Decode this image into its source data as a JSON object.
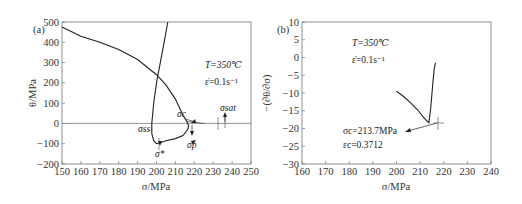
{
  "chart_data": [
    {
      "panel": "(a)",
      "type": "line",
      "title": "",
      "xlabel": "σ/MPa",
      "ylabel": "θ/MPa",
      "xlim": [
        150,
        250
      ],
      "ylim": [
        -200,
        500
      ],
      "xticks": [
        150,
        160,
        170,
        180,
        190,
        200,
        210,
        220,
        230,
        240,
        250
      ],
      "yticks": [
        500,
        400,
        300,
        200,
        100,
        0,
        -100,
        -200
      ],
      "grid": false,
      "annotations": {
        "temperature": "T=350℃",
        "strain_rate": "ε̇=0.1s⁻¹",
        "sigma_c": "σc",
        "sigma_sat": "σsat",
        "sigma_ss": "σss",
        "sigma_p": "σp",
        "sigma_star": "σ*"
      },
      "series": [
        {
          "name": "θ-σ curve",
          "x": [
            150,
            160,
            170,
            180,
            190,
            200,
            205,
            210,
            214,
            216,
            217,
            216.5,
            214,
            210,
            205,
            202,
            200,
            198.5,
            197.5,
            197.5,
            198.5,
            200,
            202,
            204,
            206
          ],
          "y": [
            475,
            430,
            400,
            365,
            315,
            240,
            190,
            120,
            40,
            10,
            -10,
            -30,
            -60,
            -75,
            -85,
            -95,
            -100,
            -85,
            -50,
            0,
            100,
            200,
            300,
            400,
            500
          ]
        },
        {
          "name": "tangent line",
          "x": [
            216,
            225.5
          ],
          "y": [
            10,
            0
          ]
        }
      ]
    },
    {
      "panel": "(b)",
      "type": "line",
      "title": "",
      "xlabel": "σ/MPa",
      "ylabel": "−(∂θ/∂σ)",
      "xlim": [
        160,
        240
      ],
      "ylim": [
        -30,
        10
      ],
      "xticks": [
        160,
        170,
        180,
        190,
        200,
        210,
        220,
        230,
        240
      ],
      "yticks": [
        10,
        5,
        0,
        -5,
        -10,
        -15,
        -20,
        -25,
        -30
      ],
      "grid": false,
      "annotations": {
        "temperature": "T=350℃",
        "strain_rate": "ε̇=0.1s⁻¹",
        "sigma_c_value": "σc=213.7MPa",
        "epsilon_c_value": "εc=0.3712"
      },
      "series": [
        {
          "name": "−dθ/dσ",
          "x": [
            200,
            203,
            206,
            209,
            211,
            212.5,
            213.7,
            214.5,
            215.3,
            216,
            216.5
          ],
          "y": [
            -9.5,
            -11,
            -12.8,
            -14.8,
            -16.5,
            -17.6,
            -18.4,
            -14,
            -8,
            -3,
            -1.5
          ]
        }
      ],
      "minimum_point": {
        "x": 213.7,
        "y": -18.4
      }
    }
  ]
}
